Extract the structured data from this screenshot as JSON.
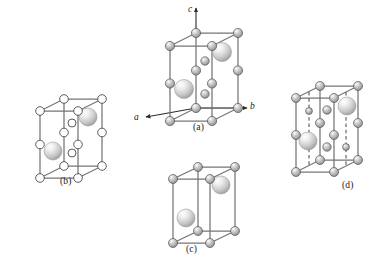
{
  "figure": {
    "background_color": "#ffffff",
    "width": 391,
    "height": 269,
    "edge_color": "#6e6e6e",
    "atom_outline_color": "#4a4a4a",
    "atom_fill_light": "#f2f2f2",
    "atom_fill_mid": "#b9b9b9",
    "atom_fill_dark": "#8a8a8a",
    "hollow_atom_fill": "#ffffff"
  },
  "axes": {
    "c_label": "c",
    "a_label": "a",
    "b_label": "b"
  },
  "panels": [
    {
      "id": "a",
      "caption": "(a)",
      "caption_x": 193,
      "caption_y": 122,
      "has_axes": true,
      "has_dashed_lines": false,
      "corner_style": "shaded",
      "small_atom_count": 14,
      "large_sphere_count": 2
    },
    {
      "id": "b",
      "caption": "(b)",
      "caption_x": 60,
      "caption_y": 176,
      "has_axes": false,
      "has_dashed_lines": false,
      "corner_style": "hollow",
      "small_atom_count": 14,
      "large_sphere_count": 2
    },
    {
      "id": "c",
      "caption": "(c)",
      "caption_x": 186,
      "caption_y": 244,
      "has_axes": false,
      "has_dashed_lines": false,
      "corner_style": "shaded",
      "small_atom_count": 8,
      "large_sphere_count": 2
    },
    {
      "id": "d",
      "caption": "(d)",
      "caption_x": 342,
      "caption_y": 180,
      "has_axes": false,
      "has_dashed_lines": true,
      "corner_style": "shaded",
      "small_atom_count": 16,
      "large_sphere_count": 2
    }
  ]
}
